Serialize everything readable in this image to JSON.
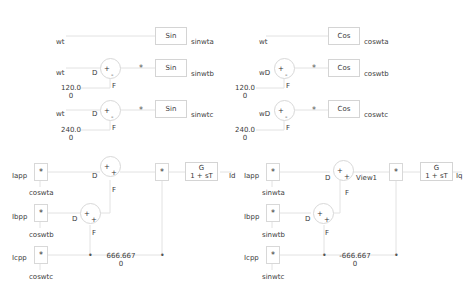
{
  "top_left": {
    "rows": [
      {
        "input": "wt",
        "block": "Sin",
        "output": "sinwta"
      },
      {
        "input": "wt",
        "sum_labels": {
          "d": "D",
          "f": "F",
          "plus": "+",
          "minus": "-"
        },
        "dot": "*",
        "block": "Sin",
        "output": "sinwtb",
        "const": [
          "120.0",
          "0"
        ]
      },
      {
        "input": "wt",
        "sum_labels": {
          "d": "D",
          "f": "F",
          "plus": "+",
          "minus": "-"
        },
        "dot": "*",
        "block": "Sin",
        "output": "sinwtc",
        "const": [
          "240.0",
          "0"
        ]
      }
    ]
  },
  "top_right": {
    "rows": [
      {
        "input": "wt",
        "block": "Cos",
        "output": "coswta"
      },
      {
        "input": "wD",
        "sum_labels": {
          "f": "F",
          "plus": "+",
          "minus": "-"
        },
        "dot": "*",
        "block": "Cos",
        "output": "coswtb",
        "const": [
          "120.0",
          "0"
        ]
      },
      {
        "input": "wD",
        "sum_labels": {
          "f": "F",
          "plus": "+",
          "minus": "-"
        },
        "dot": "*",
        "block": "Cos",
        "output": "coswtc",
        "const": [
          "240.0",
          "0"
        ]
      }
    ]
  },
  "bottom_left": {
    "inputs": [
      "Iapp",
      "Ibpp",
      "Icpp"
    ],
    "multipliers": [
      "coswta",
      "coswtb",
      "coswtc"
    ],
    "mul_symbol": "*",
    "sum1": {
      "d": "D",
      "f": "F",
      "p1": "+",
      "p2": "+"
    },
    "sum2": {
      "d": "D",
      "f": "F",
      "p1": "+",
      "p2": "+"
    },
    "gain": [
      "666.667",
      "0"
    ],
    "tf": {
      "num": "G",
      "den": "1 + sT"
    },
    "output": "Id"
  },
  "bottom_right": {
    "inputs": [
      "Iapp",
      "Ibpp",
      "Icpp"
    ],
    "multipliers": [
      "sinwta",
      "sinwtb",
      "sinwtc"
    ],
    "mul_symbol": "*",
    "sum1": {
      "d": "D",
      "f": "F",
      "p1": "+",
      "p2": "+"
    },
    "sum2": {
      "d": "D",
      "f": "F",
      "p1": "+",
      "p2": "+"
    },
    "view_label": "View1",
    "gain": [
      "-666.667",
      "0"
    ],
    "tf": {
      "num": "G",
      "den": "1 + sT"
    },
    "output": "Iq"
  }
}
